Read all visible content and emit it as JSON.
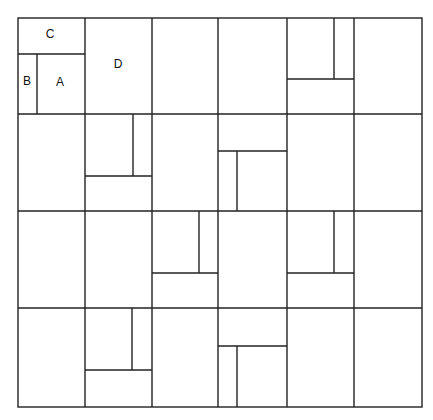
{
  "diagram": {
    "title": "",
    "grid": {
      "columns": 6,
      "rows": 4
    },
    "frame": {
      "x": 18,
      "y": 18,
      "width": 404,
      "height": 389
    },
    "column_lines_x": [
      85,
      152,
      218,
      287,
      354
    ],
    "row_lines_y": [
      114,
      211,
      308
    ],
    "sub_lines": [
      {
        "x1": 18,
        "y1": 54,
        "x2": 85,
        "y2": 54
      },
      {
        "x1": 37,
        "y1": 54,
        "x2": 37,
        "y2": 114
      },
      {
        "x1": 287,
        "y1": 79,
        "x2": 354,
        "y2": 79
      },
      {
        "x1": 334,
        "y1": 18,
        "x2": 334,
        "y2": 79
      },
      {
        "x1": 85,
        "y1": 176,
        "x2": 152,
        "y2": 176
      },
      {
        "x1": 133,
        "y1": 114,
        "x2": 133,
        "y2": 176
      },
      {
        "x1": 218,
        "y1": 151,
        "x2": 287,
        "y2": 151
      },
      {
        "x1": 237,
        "y1": 151,
        "x2": 237,
        "y2": 211
      },
      {
        "x1": 152,
        "y1": 273,
        "x2": 218,
        "y2": 273
      },
      {
        "x1": 199,
        "y1": 211,
        "x2": 199,
        "y2": 273
      },
      {
        "x1": 287,
        "y1": 273,
        "x2": 354,
        "y2": 273
      },
      {
        "x1": 334,
        "y1": 211,
        "x2": 334,
        "y2": 273
      },
      {
        "x1": 85,
        "y1": 370,
        "x2": 152,
        "y2": 370
      },
      {
        "x1": 132,
        "y1": 308,
        "x2": 132,
        "y2": 370
      },
      {
        "x1": 218,
        "y1": 346,
        "x2": 287,
        "y2": 346
      },
      {
        "x1": 237,
        "y1": 346,
        "x2": 237,
        "y2": 407
      }
    ],
    "labels": [
      {
        "text": "C",
        "x": 50,
        "y": 35
      },
      {
        "text": "B",
        "x": 27,
        "y": 82
      },
      {
        "text": "A",
        "x": 60,
        "y": 83
      },
      {
        "text": "D",
        "x": 118,
        "y": 65
      }
    ]
  }
}
